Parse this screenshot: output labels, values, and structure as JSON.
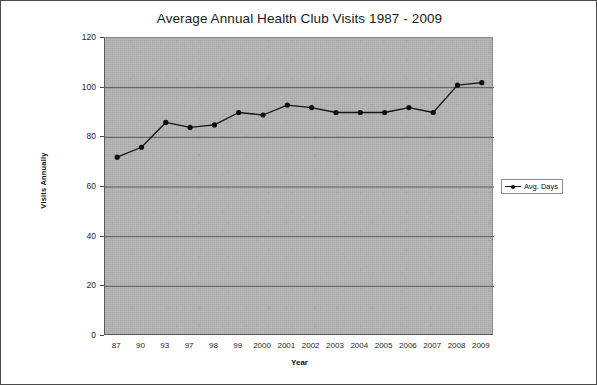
{
  "chart_data": {
    "type": "line",
    "title": "Average Annual Health Club Visits 1987 - 2009",
    "xlabel": "Year",
    "ylabel": "Visits Annually",
    "categories": [
      "87",
      "90",
      "93",
      "97",
      "98",
      "99",
      "2000",
      "2001",
      "2002",
      "2003",
      "2004",
      "2005",
      "2006",
      "2007",
      "2008",
      "2009"
    ],
    "series": [
      {
        "name": "Avg. Days",
        "values": [
          72,
          76,
          86,
          84,
          85,
          90,
          89,
          93,
          92,
          90,
          90,
          90,
          92,
          90,
          101,
          102
        ]
      }
    ],
    "ylim": [
      0,
      120
    ],
    "ytick_values": [
      0,
      20,
      40,
      60,
      80,
      100,
      120
    ],
    "ytick_labels": [
      "0",
      "20",
      "40",
      "60",
      "80",
      "100",
      "120"
    ],
    "grid": "horizontal",
    "legend_position": "right",
    "legend_entries": [
      "Avg. Days"
    ],
    "colors": {
      "line": "#141414",
      "marker": "#0d0d0d",
      "plot_background": "#b4b4b4",
      "gridline": "#5a5a5a",
      "axis": "#4a4a4a",
      "page_background": "#ffffff",
      "border": "#4a4a4a",
      "text": "#1a1a1a"
    }
  }
}
